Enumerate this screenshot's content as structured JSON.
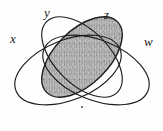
{
  "figure": {
    "kind": "four-set-venn-diagram",
    "caption": "",
    "background_color": "#fefefe",
    "stroke_color": "#1c1c1c",
    "shade_fill_color": "#a8a8a8",
    "shade_texture": "mottled-engraved-gray"
  },
  "labels": {
    "x": "x",
    "y": "y",
    "z": "z",
    "w": "w"
  },
  "sets": [
    {
      "id": "x",
      "label": "x",
      "shaded": false,
      "cx": 68,
      "cy": 70,
      "rx": 56,
      "ry": 30,
      "rotation": -22
    },
    {
      "id": "y",
      "label": "y",
      "shaded": true,
      "cx": 82,
      "cy": 57,
      "rx": 50,
      "ry": 27,
      "rotation": -45
    },
    {
      "id": "z",
      "label": "z",
      "shaded": false,
      "cx": 82,
      "cy": 57,
      "rx": 50,
      "ry": 27,
      "rotation": 45
    },
    {
      "id": "w",
      "label": "w",
      "shaded": false,
      "cx": 96,
      "cy": 70,
      "rx": 56,
      "ry": 30,
      "rotation": 22
    }
  ],
  "marks": [
    {
      "id": "center-dot",
      "type": "dot",
      "x": 82,
      "y": 107,
      "r": 1
    }
  ]
}
